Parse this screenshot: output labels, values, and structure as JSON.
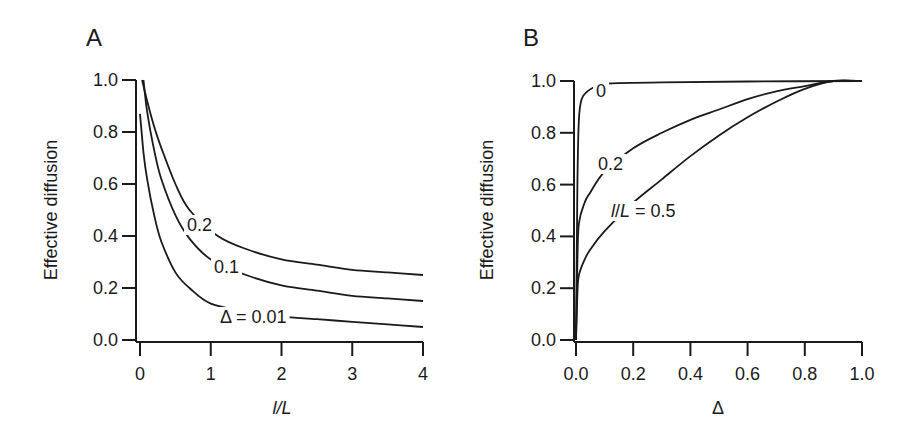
{
  "chart_data": [
    {
      "type": "line",
      "panel": "A",
      "title": "",
      "xlabel": "l/L",
      "ylabel": "Effective diffusion",
      "xlim": [
        0,
        4
      ],
      "ylim": [
        0,
        1
      ],
      "xticks": [
        "0",
        "1",
        "2",
        "3",
        "4"
      ],
      "yticks": [
        "0.0",
        "0.2",
        "0.4",
        "0.6",
        "0.8",
        "1.0"
      ],
      "grid": false,
      "legend": "inline curve labels",
      "series": [
        {
          "name": "Δ = 0.2",
          "label": "0.2",
          "x": [
            0.03,
            0.1,
            0.2,
            0.3,
            0.5,
            0.7,
            1.1,
            1.5,
            2,
            2.5,
            3,
            3.5,
            4
          ],
          "y": [
            1.0,
            0.92,
            0.82,
            0.74,
            0.6,
            0.5,
            0.4,
            0.35,
            0.31,
            0.29,
            0.27,
            0.26,
            0.25
          ]
        },
        {
          "name": "Δ = 0.1",
          "label": "0.1",
          "x": [
            0.05,
            0.1,
            0.2,
            0.3,
            0.5,
            0.7,
            1.0,
            1.5,
            2,
            2.5,
            3,
            3.5,
            4
          ],
          "y": [
            1.0,
            0.88,
            0.73,
            0.62,
            0.48,
            0.39,
            0.31,
            0.25,
            0.21,
            0.19,
            0.17,
            0.16,
            0.15
          ]
        },
        {
          "name": "Δ = 0.01",
          "label": "Δ = 0.01",
          "x": [
            0.0,
            0.05,
            0.1,
            0.2,
            0.3,
            0.5,
            0.7,
            1.0,
            1.5,
            2,
            2.5,
            3,
            3.5,
            4
          ],
          "y": [
            0.87,
            0.72,
            0.62,
            0.48,
            0.38,
            0.26,
            0.2,
            0.14,
            0.11,
            0.09,
            0.08,
            0.07,
            0.06,
            0.05
          ]
        }
      ]
    },
    {
      "type": "line",
      "panel": "B",
      "title": "",
      "xlabel": "Δ",
      "ylabel": "Effective diffusion",
      "xlim": [
        0,
        1
      ],
      "ylim": [
        0,
        1
      ],
      "xticks": [
        "0.0",
        "0.2",
        "0.4",
        "0.6",
        "0.8",
        "1.0"
      ],
      "yticks": [
        "0.0",
        "0.2",
        "0.4",
        "0.6",
        "0.8",
        "1.0"
      ],
      "grid": false,
      "legend": "inline curve labels",
      "series": [
        {
          "name": "l/L = 0",
          "label": "0",
          "x": [
            0.0,
            0.005,
            0.01,
            0.02,
            0.04,
            0.07,
            0.1,
            0.3,
            0.6,
            1.0
          ],
          "y": [
            0.0,
            0.6,
            0.85,
            0.93,
            0.96,
            0.98,
            0.99,
            0.995,
            0.998,
            1.0
          ]
        },
        {
          "name": "l/L = 0.2",
          "label": "0.2",
          "x": [
            0.0,
            0.005,
            0.01,
            0.03,
            0.05,
            0.1,
            0.2,
            0.3,
            0.4,
            0.5,
            0.6,
            0.7,
            0.8,
            0.9,
            1.0
          ],
          "y": [
            0.0,
            0.3,
            0.45,
            0.53,
            0.57,
            0.65,
            0.74,
            0.8,
            0.85,
            0.89,
            0.93,
            0.96,
            0.98,
            1.0,
            1.0
          ]
        },
        {
          "name": "l/L = 0.5",
          "label": "l/L = 0.5",
          "x": [
            0.0,
            0.005,
            0.01,
            0.03,
            0.05,
            0.1,
            0.2,
            0.3,
            0.4,
            0.5,
            0.6,
            0.7,
            0.8,
            0.9,
            1.0
          ],
          "y": [
            0.0,
            0.18,
            0.25,
            0.31,
            0.35,
            0.42,
            0.53,
            0.62,
            0.71,
            0.79,
            0.86,
            0.92,
            0.97,
            1.0,
            1.0
          ]
        }
      ]
    }
  ],
  "panels": {
    "a": {
      "label": "A",
      "ylabel": "Effective diffusion",
      "xlabel_main": "l",
      "xlabel_rest": "/L",
      "curve_labels": [
        "0.2",
        "0.1",
        "Δ = 0.01"
      ]
    },
    "b": {
      "label": "B",
      "ylabel": "Effective diffusion",
      "xlabel": "Δ",
      "curve_labels": [
        "0",
        "0.2",
        "l/L = 0.5"
      ]
    }
  }
}
